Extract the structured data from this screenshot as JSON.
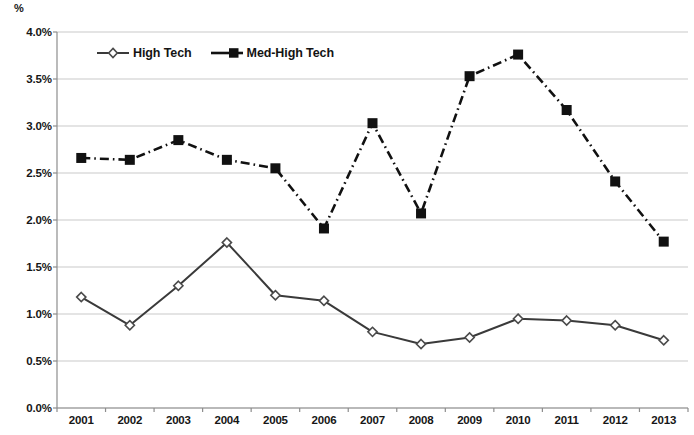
{
  "chart_data": {
    "type": "line",
    "title": "",
    "xlabel": "",
    "ylabel": "%",
    "categories": [
      "2001",
      "2002",
      "2003",
      "2004",
      "2005",
      "2006",
      "2007",
      "2008",
      "2009",
      "2010",
      "2011",
      "2012",
      "2013"
    ],
    "series": [
      {
        "name": "High Tech",
        "marker": "open-diamond",
        "line_style": "solid",
        "color": "#3a3a3a",
        "values": [
          1.18,
          0.88,
          1.3,
          1.76,
          1.2,
          1.14,
          0.81,
          0.68,
          0.75,
          0.95,
          0.93,
          0.88,
          0.72
        ]
      },
      {
        "name": "Med-High Tech",
        "marker": "filled-square",
        "line_style": "dash-dot",
        "color": "#111111",
        "values": [
          2.66,
          2.64,
          2.85,
          2.64,
          2.55,
          1.91,
          3.03,
          2.07,
          3.53,
          3.76,
          3.17,
          2.41,
          1.77
        ]
      }
    ],
    "ylim": [
      0.0,
      4.0
    ],
    "y_ticks": [
      "0.0%",
      "0.5%",
      "1.0%",
      "1.5%",
      "2.0%",
      "2.5%",
      "3.0%",
      "3.5%",
      "4.0%"
    ],
    "y_tick_values": [
      0.0,
      0.5,
      1.0,
      1.5,
      2.0,
      2.5,
      3.0,
      3.5,
      4.0
    ],
    "grid": true,
    "grid_color": "#c9c9c9",
    "axis_color": "#8d8d8d",
    "legend_position": "top-left-inside"
  },
  "legend": {
    "items": [
      {
        "label": "High Tech"
      },
      {
        "label": "Med-High Tech"
      }
    ]
  },
  "axis": {
    "y_unit": "%"
  }
}
